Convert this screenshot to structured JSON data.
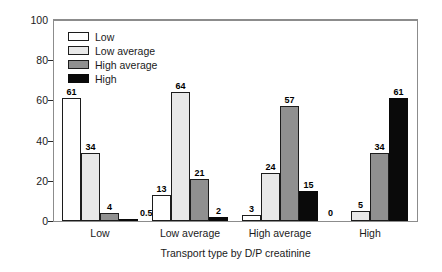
{
  "chart_data": {
    "type": "bar",
    "title": "",
    "xlabel": "Transport type by D/P creatinine",
    "ylabel": "Percentage of patients",
    "categories": [
      "Low",
      "Low average",
      "High average",
      "High"
    ],
    "ylim": [
      0,
      100
    ],
    "yticks": [
      0,
      20,
      40,
      60,
      80,
      100
    ],
    "ytick_labels": [
      "0",
      "20",
      "40",
      "60",
      "80",
      "100"
    ],
    "grid": false,
    "legend_position": "top-left",
    "series": [
      {
        "name": "Low",
        "color": "#ffffff",
        "values": [
          61,
          13,
          3,
          0
        ],
        "labels": [
          "61",
          "13",
          "3",
          "0"
        ]
      },
      {
        "name": "Low average",
        "color": "#e8e8e8",
        "values": [
          34,
          64,
          24,
          5
        ],
        "labels": [
          "34",
          "64",
          "24",
          "5"
        ]
      },
      {
        "name": "High average",
        "color": "#909090",
        "values": [
          4,
          21,
          57,
          34
        ],
        "labels": [
          "4",
          "21",
          "57",
          "34"
        ]
      },
      {
        "name": "High",
        "color": "#0a0a0a",
        "values": [
          0.5,
          2,
          15,
          61
        ],
        "labels": [
          "0.5",
          "2",
          "15",
          "61"
        ]
      }
    ]
  },
  "legend": {
    "items": [
      {
        "label": "Low"
      },
      {
        "label": "Low average"
      },
      {
        "label": "High average"
      },
      {
        "label": "High"
      }
    ]
  }
}
